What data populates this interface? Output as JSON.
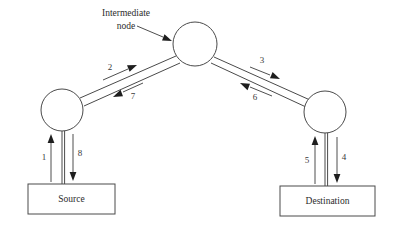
{
  "diagram": {
    "background_color": "#ffffff",
    "line_color": "#4a4a4a",
    "text_color": "#2b2b2b",
    "annotation": {
      "line1": "Intermediate",
      "line2": "node"
    },
    "nodes": [
      {
        "id": "source-node",
        "label": "",
        "shape": "circle",
        "cx": 62,
        "cy": 110,
        "r": 21
      },
      {
        "id": "intermediate-node",
        "label": "",
        "shape": "circle",
        "cx": 195,
        "cy": 44,
        "r": 22
      },
      {
        "id": "destination-node",
        "label": "",
        "shape": "circle",
        "cx": 325,
        "cy": 112,
        "r": 21
      }
    ],
    "boxes": [
      {
        "id": "source-box",
        "label": "Source",
        "x": 28,
        "y": 184,
        "w": 87,
        "h": 30
      },
      {
        "id": "destination-box",
        "label": "Destination",
        "x": 280,
        "y": 186,
        "w": 95,
        "h": 30
      }
    ],
    "edges": [
      {
        "id": "edge-1",
        "label": "1",
        "from": "source-box",
        "to": "source-node",
        "direction": "up"
      },
      {
        "id": "edge-2",
        "label": "2",
        "from": "source-node",
        "to": "intermediate-node",
        "direction": "up-right"
      },
      {
        "id": "edge-3",
        "label": "3",
        "from": "intermediate-node",
        "to": "destination-node",
        "direction": "down-right"
      },
      {
        "id": "edge-4",
        "label": "4",
        "from": "destination-node",
        "to": "destination-box",
        "direction": "down"
      },
      {
        "id": "edge-5",
        "label": "5",
        "from": "destination-box",
        "to": "destination-node",
        "direction": "up"
      },
      {
        "id": "edge-6",
        "label": "6",
        "from": "destination-node",
        "to": "intermediate-node",
        "direction": "up-left"
      },
      {
        "id": "edge-7",
        "label": "7",
        "from": "intermediate-node",
        "to": "source-node",
        "direction": "down-left"
      },
      {
        "id": "edge-8",
        "label": "8",
        "from": "source-node",
        "to": "source-box",
        "direction": "down"
      }
    ]
  }
}
